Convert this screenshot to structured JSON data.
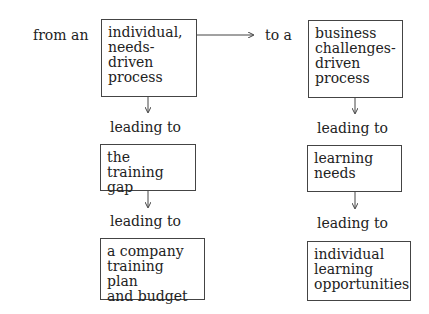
{
  "left_column": {
    "intro": "from an",
    "boxes": [
      {
        "text": "individual,\nneeds-\ndriven\nprocess"
      },
      {
        "text": "the training\ngap"
      },
      {
        "text": "a company\ntraining plan\nand budget"
      }
    ],
    "connectors": [
      "leading to",
      "leading to"
    ]
  },
  "right_column": {
    "intro": "to a",
    "boxes": [
      {
        "text": "business\nchallenges-\ndriven\nprocess"
      },
      {
        "text": "learning\nneeds"
      },
      {
        "text": "individual\nlearning\nopportunities"
      }
    ],
    "connectors": [
      "leading to",
      "leading to"
    ]
  },
  "colors": {
    "line": "#444444",
    "text": "#222222",
    "background": "#ffffff"
  }
}
